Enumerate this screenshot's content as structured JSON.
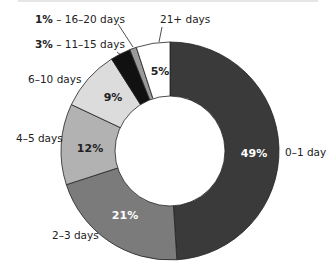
{
  "chart_data": {
    "type": "pie",
    "donut": true,
    "title": "",
    "categories": [
      "0–1 day",
      "2–3 days",
      "4–5 days",
      "6–10 days",
      "11–15 days",
      "16–20 days",
      "21+ days"
    ],
    "values": [
      49,
      21,
      12,
      9,
      3,
      1,
      5
    ],
    "value_labels": [
      "49%",
      "21%",
      "12%",
      "9%",
      "3%",
      "1%",
      "5%"
    ],
    "colors": [
      "#3a3a3a",
      "#7b7b7b",
      "#b2b2b2",
      "#dcdcdc",
      "#111111",
      "#9a9a9a",
      "#ffffff"
    ],
    "legend": "none (direct labels)"
  },
  "labels": {
    "d0": "0–1 day",
    "d2": "2–3 days",
    "d4": "4–5 days",
    "d6": "6–10 days",
    "d11_pct": "3%",
    "d11": " – 11–15 days",
    "d16_pct": "1%",
    "d16": " – 16–20 days",
    "d21": "21+ days"
  },
  "pcts": {
    "p49": "49%",
    "p21": "21%",
    "p12": "12%",
    "p9": "9%",
    "p5": "5%"
  }
}
